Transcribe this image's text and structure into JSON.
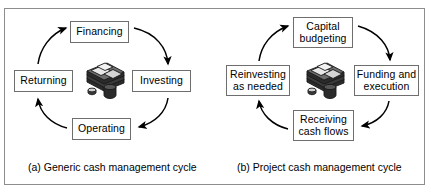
{
  "figure": {
    "background_color": "#ffffff",
    "frame_color": "#8d8d8d",
    "box_border_color": "#6e6e6e",
    "arrow_color": "#000000",
    "text_color": "#000000"
  },
  "panels": [
    {
      "id": "a",
      "caption": "(a) Generic cash management cycle",
      "center_icon": "money-stack-icon",
      "nodes": [
        {
          "id": "financing",
          "label": "Financing",
          "position": "top"
        },
        {
          "id": "investing",
          "label": "Investing",
          "position": "right"
        },
        {
          "id": "operating",
          "label": "Operating",
          "position": "bottom"
        },
        {
          "id": "returning",
          "label": "Returning",
          "position": "left"
        }
      ],
      "arrows": [
        {
          "from": "financing",
          "to": "investing",
          "direction": "clockwise"
        },
        {
          "from": "investing",
          "to": "operating",
          "direction": "clockwise"
        },
        {
          "from": "operating",
          "to": "returning",
          "direction": "clockwise"
        },
        {
          "from": "returning",
          "to": "financing",
          "direction": "clockwise"
        }
      ]
    },
    {
      "id": "b",
      "caption": "(b) Project cash management cycle",
      "center_icon": "money-stack-icon",
      "nodes": [
        {
          "id": "capital-budgeting",
          "label": "Capital\nbudgeting",
          "position": "top"
        },
        {
          "id": "funding-execution",
          "label": "Funding and\nexecution",
          "position": "right"
        },
        {
          "id": "receiving-cash-flows",
          "label": "Receiving\ncash flows",
          "position": "bottom"
        },
        {
          "id": "reinvesting",
          "label": "Reinvesting\nas needed",
          "position": "left"
        }
      ],
      "arrows": [
        {
          "from": "capital-budgeting",
          "to": "funding-execution",
          "direction": "clockwise"
        },
        {
          "from": "funding-execution",
          "to": "receiving-cash-flows",
          "direction": "clockwise"
        },
        {
          "from": "receiving-cash-flows",
          "to": "reinvesting",
          "direction": "clockwise"
        },
        {
          "from": "reinvesting",
          "to": "capital-budgeting",
          "direction": "clockwise"
        }
      ]
    }
  ]
}
